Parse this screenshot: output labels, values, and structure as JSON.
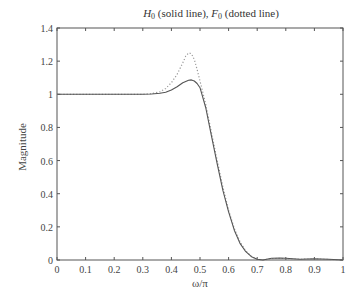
{
  "chart_data": {
    "type": "line",
    "title": "H0 (solid line), F0 (dotted line)",
    "title_parts": {
      "h_symbol": "H",
      "h_sub": "0",
      "h_text": " (solid line), ",
      "f_symbol": "F",
      "f_sub": "0",
      "f_text": " (dotted line)"
    },
    "xlabel": "ω/π",
    "ylabel": "Magnitude",
    "xlim": [
      0,
      1
    ],
    "ylim": [
      0,
      1.4
    ],
    "xticks": [
      0,
      0.1,
      0.2,
      0.3,
      0.4,
      0.5,
      0.6,
      0.7,
      0.8,
      0.9,
      1
    ],
    "xtick_labels": [
      "0",
      "0.1",
      "0.2",
      "0.3",
      "0.4",
      "0.5",
      "0.6",
      "0.7",
      "0.8",
      "0.9",
      "1"
    ],
    "yticks": [
      0,
      0.2,
      0.4,
      0.6,
      0.8,
      1,
      1.2,
      1.4
    ],
    "ytick_labels": [
      "0",
      "0.2",
      "0.4",
      "0.6",
      "0.8",
      "1",
      "1.2",
      "1.4"
    ],
    "grid": false,
    "legend": "none (described in title)",
    "series": [
      {
        "name": "H0",
        "style": "solid",
        "color": "#555555",
        "x": [
          0,
          0.1,
          0.2,
          0.3,
          0.33,
          0.36,
          0.38,
          0.4,
          0.42,
          0.44,
          0.46,
          0.47,
          0.48,
          0.49,
          0.5,
          0.52,
          0.54,
          0.56,
          0.58,
          0.6,
          0.62,
          0.64,
          0.66,
          0.68,
          0.7,
          0.72,
          0.75,
          0.78,
          0.8,
          0.85,
          0.9,
          0.95,
          1.0
        ],
        "values": [
          1.0,
          1.0,
          1.0,
          1.0,
          1.002,
          1.006,
          1.012,
          1.025,
          1.045,
          1.07,
          1.085,
          1.087,
          1.08,
          1.065,
          1.04,
          0.92,
          0.75,
          0.58,
          0.42,
          0.29,
          0.18,
          0.1,
          0.05,
          0.02,
          0.005,
          0.0,
          0.01,
          0.012,
          0.01,
          0.005,
          0.008,
          0.004,
          0.0
        ]
      },
      {
        "name": "F0",
        "style": "dotted",
        "color": "#999999",
        "x": [
          0,
          0.1,
          0.2,
          0.3,
          0.33,
          0.36,
          0.38,
          0.4,
          0.42,
          0.44,
          0.45,
          0.46,
          0.47,
          0.48,
          0.49,
          0.5,
          0.52,
          0.54,
          0.56,
          0.58,
          0.6,
          0.62,
          0.64,
          0.66,
          0.68,
          0.7,
          0.72,
          0.75,
          0.78,
          0.8,
          0.85,
          0.9,
          0.95,
          1.0
        ],
        "values": [
          1.0,
          1.0,
          1.0,
          1.0,
          1.004,
          1.015,
          1.035,
          1.07,
          1.12,
          1.19,
          1.23,
          1.25,
          1.245,
          1.21,
          1.15,
          1.08,
          0.94,
          0.77,
          0.6,
          0.44,
          0.3,
          0.19,
          0.11,
          0.055,
          0.02,
          0.005,
          0.0,
          0.008,
          0.01,
          0.008,
          0.004,
          0.006,
          0.003,
          0.0
        ]
      }
    ]
  },
  "layout": {
    "plot_left": 57,
    "plot_right": 343,
    "plot_top": 28,
    "plot_bottom": 260
  }
}
